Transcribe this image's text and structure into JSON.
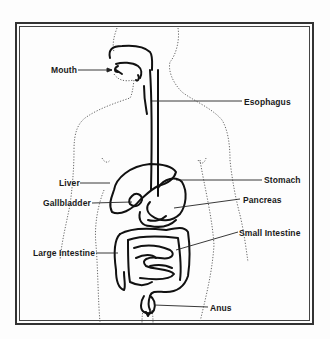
{
  "diagram": {
    "type": "anatomical-illustration",
    "labels": [
      {
        "id": "mouth",
        "text": "Mouth"
      },
      {
        "id": "esophagus",
        "text": "Esophagus"
      },
      {
        "id": "liver",
        "text": "Liver"
      },
      {
        "id": "stomach",
        "text": "Stomach"
      },
      {
        "id": "gallbladder",
        "text": "Gallbladder"
      },
      {
        "id": "pancreas",
        "text": "Pancreas"
      },
      {
        "id": "small_intestine",
        "text": "Small Intestine"
      },
      {
        "id": "large_intestine",
        "text": "Large Intestine"
      },
      {
        "id": "anus",
        "text": "Anus"
      }
    ]
  },
  "colors": {
    "line": "#111111",
    "body_outline": "#555555",
    "background": "#fdfdfd"
  }
}
